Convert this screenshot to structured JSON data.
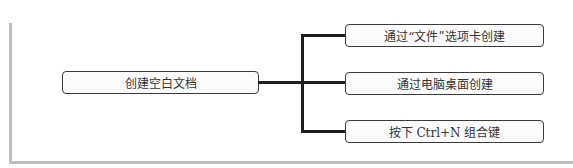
{
  "diagram": {
    "type": "mind-map",
    "root": {
      "label": "创建空白文档"
    },
    "branches": [
      {
        "label": "通过“文件”选项卡创建"
      },
      {
        "label": "通过电脑桌面创建"
      },
      {
        "label": "按下 Ctrl+N 组合键"
      }
    ],
    "colors": {
      "line": "#1f1f1f",
      "border": "#3a3a3a",
      "frame": "#bdbdbd",
      "node_fill": "#fbfbfb"
    }
  }
}
